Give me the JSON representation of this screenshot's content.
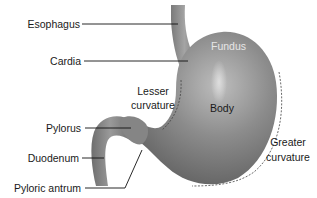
{
  "diagram": {
    "colors": {
      "organ_dark": "#5a5a5a",
      "organ_mid": "#8a8a8a",
      "organ_highlight": "#d8d8d8",
      "leader_line": "#111111",
      "text": "#1a1a1a",
      "text_on_organ": "#e6e6e6"
    },
    "labels": {
      "esophagus": "Esophagus",
      "cardia": "Cardia",
      "fundus": "Fundus",
      "lesser_curvature_line1": "Lesser",
      "lesser_curvature_line2": "curvature",
      "body": "Body",
      "pylorus": "Pylorus",
      "duodenum": "Duodenum",
      "pyloric_antrum": "Pyloric antrum",
      "greater_curvature_line1": "Greater",
      "greater_curvature_line2": "curvature"
    }
  }
}
